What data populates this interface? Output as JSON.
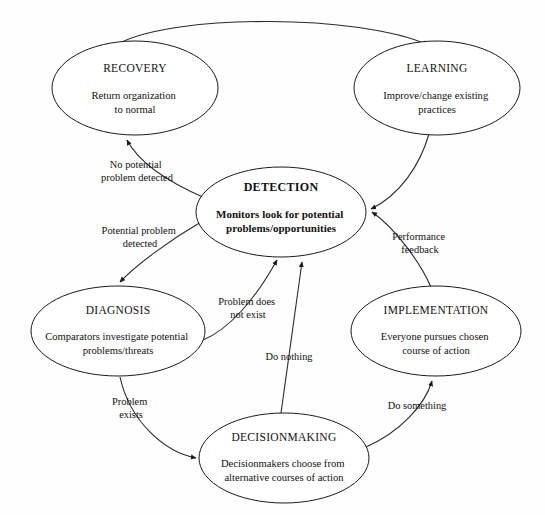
{
  "diagram": {
    "type": "cycle-flowchart",
    "background_color": "#fefefe",
    "stroke_color": "#1b1b1b",
    "text_color": "#111111"
  },
  "nodes": [
    {
      "id": "recovery",
      "title": "RECOVERY",
      "line1": "Return organization",
      "line2": "to normal",
      "bold": false,
      "cx": 135,
      "cy": 88,
      "rx": 83,
      "ry": 47
    },
    {
      "id": "learning",
      "title": "LEARNING",
      "line1": "Improve/change existing",
      "line2": "practices",
      "bold": false,
      "cx": 437,
      "cy": 88,
      "rx": 83,
      "ry": 47
    },
    {
      "id": "detection",
      "title": "DETECTION",
      "line1": "Monitors look for potential",
      "line2": "problems/opportunities",
      "bold": true,
      "cx": 281,
      "cy": 212,
      "rx": 85,
      "ry": 45
    },
    {
      "id": "diagnosis",
      "title": "DIAGNOSIS",
      "line1": "Comparators investigate potential",
      "line2": "problems/threats",
      "bold": false,
      "cx": 118,
      "cy": 331,
      "rx": 87,
      "ry": 45
    },
    {
      "id": "implementation",
      "title": "IMPLEMENTATION",
      "line1": "Everyone pursues chosen",
      "line2": "course of action",
      "bold": false,
      "cx": 436,
      "cy": 331,
      "rx": 85,
      "ry": 45
    },
    {
      "id": "decisionmaking",
      "title": "DECISIONMAKING",
      "line1": "Decisionmakers choose from",
      "line2": "alternative courses of action",
      "bold": false,
      "cx": 284,
      "cy": 458,
      "rx": 85,
      "ry": 45
    }
  ],
  "edges": [
    {
      "id": "recovery-to-learning",
      "from": "recovery",
      "to": "learning",
      "label": "",
      "label_line2": ""
    },
    {
      "id": "detection-to-recovery",
      "from": "detection",
      "to": "recovery",
      "label": "No potential",
      "label_line2": "problem detected",
      "label_x": 137,
      "label_y": 168
    },
    {
      "id": "detection-to-diagnosis",
      "from": "detection",
      "to": "diagnosis",
      "label": "Potential problem",
      "label_line2": "detected",
      "label_x": 140,
      "label_y": 234
    },
    {
      "id": "diagnosis-to-detection",
      "from": "diagnosis",
      "to": "detection",
      "label": "Problem does",
      "label_line2": "not exist",
      "label_x": 248,
      "label_y": 305
    },
    {
      "id": "diagnosis-to-decisionmaking",
      "from": "diagnosis",
      "to": "decisionmaking",
      "label": "Problem",
      "label_line2": "exists",
      "label_x": 131,
      "label_y": 405
    },
    {
      "id": "decisionmaking-to-detection",
      "from": "decisionmaking",
      "to": "detection",
      "label": "Do nothing",
      "label_line2": "",
      "label_x": 289,
      "label_y": 360
    },
    {
      "id": "decisionmaking-to-implementation",
      "from": "decisionmaking",
      "to": "implementation",
      "label": "Do something",
      "label_line2": "",
      "label_x": 417,
      "label_y": 409
    },
    {
      "id": "implementation-to-detection",
      "from": "implementation",
      "to": "detection",
      "label": "Performance",
      "label_line2": "feedback",
      "label_x": 420,
      "label_y": 240
    },
    {
      "id": "learning-to-detection",
      "from": "learning",
      "to": "detection",
      "label": "",
      "label_line2": ""
    }
  ]
}
